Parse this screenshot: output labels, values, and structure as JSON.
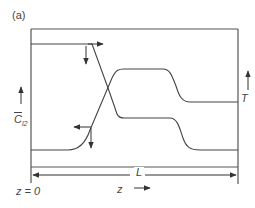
{
  "figure": {
    "panel_label": "(a)",
    "left_axis": {
      "symbol": "C",
      "subscript": "l2",
      "overbar": true,
      "arrow": "up"
    },
    "right_axis": {
      "symbol": "T",
      "arrow": "up"
    },
    "length_label": "L",
    "origin_label": "z = 0",
    "direction_label": "z",
    "direction_arrow": "right",
    "colors": {
      "line": "#444444",
      "background": "#ffffff"
    },
    "curves": [
      {
        "name": "temperature-profile",
        "description": "low flat at left, steep rise near inlet, high plateau, drop to intermediate level toward z = L"
      },
      {
        "name": "chlorine-concentration-profile",
        "description": "high at z = 0, steep linear decrease, intermediate plateau, drop to low level toward z = L"
      }
    ]
  }
}
